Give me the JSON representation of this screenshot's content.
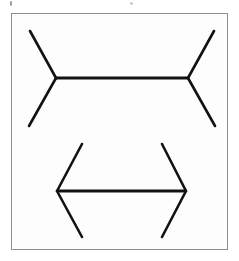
{
  "document": {
    "title": "Müller-Lyer Illusion Figure",
    "background_color": "#ffffff",
    "width": 239,
    "height": 261
  },
  "frame": {
    "name": "figure-border",
    "border_color": "#8e8e93",
    "fill_color": "#fdfdfd",
    "x": 11,
    "y": 13,
    "width": 217,
    "height": 237
  },
  "artifacts": [
    {
      "name": "speckle-left",
      "x": 10,
      "y": 1,
      "width": 2,
      "height": 5,
      "color": "#9a9aa0"
    },
    {
      "name": "speckle-mid",
      "x": 130,
      "y": 2,
      "width": 3,
      "height": 3,
      "color": "#cfcfd3"
    }
  ],
  "illusion": {
    "name": "muller-lyer",
    "line_color": "#121212",
    "stroke_width": 2.6,
    "figures": [
      {
        "id": "top-figure",
        "label": "outward-fins-shaft",
        "fin_direction": "outward",
        "appears": "longer",
        "shaft": {
          "x1": 56,
          "y1": 78,
          "x2": 188,
          "y2": 78,
          "length_px": 132
        },
        "fins": [
          {
            "name": "top-left-upper-fin",
            "x1": 56,
            "y1": 78,
            "x2": 30,
            "y2": 31
          },
          {
            "name": "top-left-lower-fin",
            "x1": 56,
            "y1": 78,
            "x2": 29,
            "y2": 126
          },
          {
            "name": "top-right-upper-fin",
            "x1": 188,
            "y1": 78,
            "x2": 214,
            "y2": 31
          },
          {
            "name": "top-right-lower-fin",
            "x1": 188,
            "y1": 78,
            "x2": 215,
            "y2": 126
          }
        ]
      },
      {
        "id": "bottom-figure",
        "label": "inward-fins-shaft",
        "fin_direction": "inward",
        "appears": "shorter",
        "shaft": {
          "x1": 57,
          "y1": 191,
          "x2": 186,
          "y2": 191,
          "length_px": 129
        },
        "fins": [
          {
            "name": "bottom-left-upper-fin",
            "x1": 57,
            "y1": 191,
            "x2": 82,
            "y2": 144
          },
          {
            "name": "bottom-left-lower-fin",
            "x1": 57,
            "y1": 191,
            "x2": 82,
            "y2": 237
          },
          {
            "name": "bottom-right-upper-fin",
            "x1": 186,
            "y1": 191,
            "x2": 162,
            "y2": 144
          },
          {
            "name": "bottom-right-lower-fin",
            "x1": 186,
            "y1": 191,
            "x2": 162,
            "y2": 237
          }
        ]
      }
    ]
  }
}
